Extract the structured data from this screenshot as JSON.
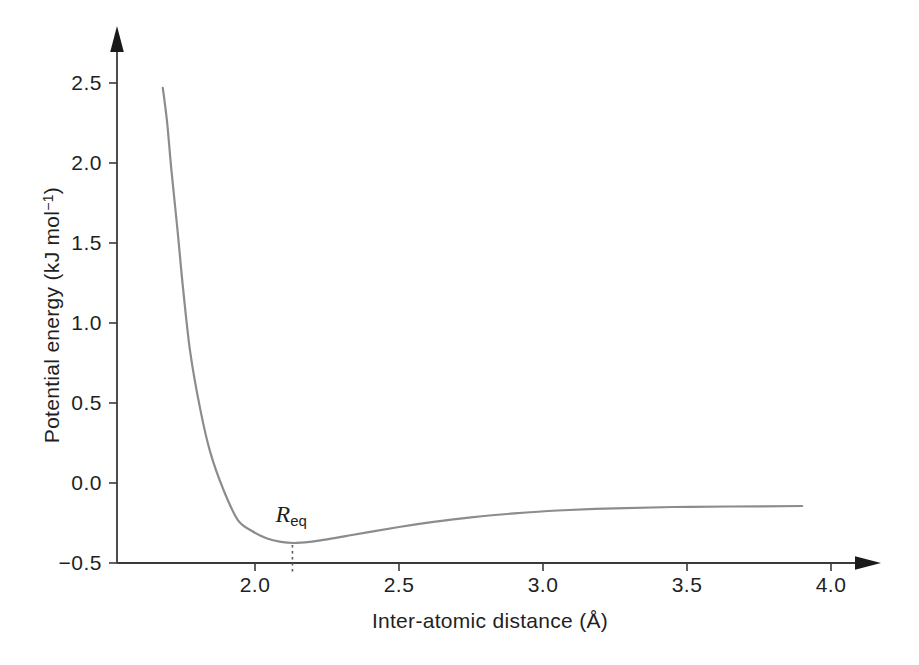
{
  "chart_data": {
    "type": "line",
    "title": "",
    "xlabel": "Inter-atomic distance (Å)",
    "ylabel": "Potential energy (kJ mol−1)",
    "ylabel_parts": {
      "pre": "Potential energy (kJ mol",
      "sup": "−1",
      "post": ")"
    },
    "xlim": [
      1.5,
      4.17
    ],
    "ylim": [
      -0.5,
      2.85
    ],
    "grid": false,
    "legend": "none",
    "x_tick_values": [
      2.0,
      2.5,
      3.0,
      3.5,
      4.0
    ],
    "x_tick_labels": [
      "2.0",
      "2.5",
      "3.0",
      "3.5",
      "4.0"
    ],
    "y_tick_values": [
      2.5,
      2.0,
      1.5,
      1.0,
      0.5,
      0.0,
      -0.5
    ],
    "y_tick_labels": [
      "2.5",
      "2.0",
      "1.5",
      "1.0",
      "0.5",
      "0.0",
      "−0.5"
    ],
    "series": [
      {
        "name": "potential-energy-curve",
        "x": [
          1.68,
          1.695,
          1.71,
          1.73,
          1.75,
          1.775,
          1.81,
          1.845,
          1.89,
          1.94,
          1.99,
          2.04,
          2.09,
          2.135,
          2.19,
          2.25,
          2.32,
          2.4,
          2.5,
          2.62,
          2.75,
          2.9,
          3.05,
          3.25,
          3.45,
          3.65,
          3.9
        ],
        "y": [
          2.47,
          2.25,
          1.95,
          1.6,
          1.22,
          0.82,
          0.46,
          0.19,
          -0.04,
          -0.23,
          -0.3,
          -0.345,
          -0.368,
          -0.375,
          -0.368,
          -0.352,
          -0.33,
          -0.305,
          -0.275,
          -0.243,
          -0.215,
          -0.19,
          -0.172,
          -0.158,
          -0.15,
          -0.147,
          -0.144
        ]
      }
    ],
    "annotations": [
      {
        "id": "equilibrium-distance",
        "label_main": "R",
        "label_sub": "eq",
        "x": 2.13,
        "y_curve": -0.375,
        "style": "dotted-vertical-line"
      }
    ],
    "colors": {
      "curve": "#8c8c8c",
      "axis": "#3a3a3a",
      "text": "#1f1f1f",
      "dotted_line": "#5a5a5a",
      "background": "#ffffff"
    }
  }
}
